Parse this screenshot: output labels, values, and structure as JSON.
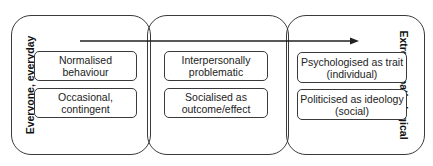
{
  "diagram": {
    "left_axis_label": "Everyone, everyday",
    "right_axis_label": "Extreme, pathological",
    "arrow": {
      "direction": "left-to-right"
    },
    "panels": [
      {
        "boxes": [
          {
            "line1": "Normalised",
            "line2": "behaviour"
          },
          {
            "line1": "Occasional,",
            "line2": "contingent"
          }
        ]
      },
      {
        "boxes": [
          {
            "line1": "Interpersonally",
            "line2": "problematic"
          },
          {
            "line1": "Socialised as",
            "line2": "outcome/effect"
          }
        ]
      },
      {
        "boxes": [
          {
            "line1": "Psychologised as trait",
            "line2": "(individual)"
          },
          {
            "line1": "Politicised as ideology",
            "line2": "(social)"
          }
        ]
      }
    ]
  }
}
